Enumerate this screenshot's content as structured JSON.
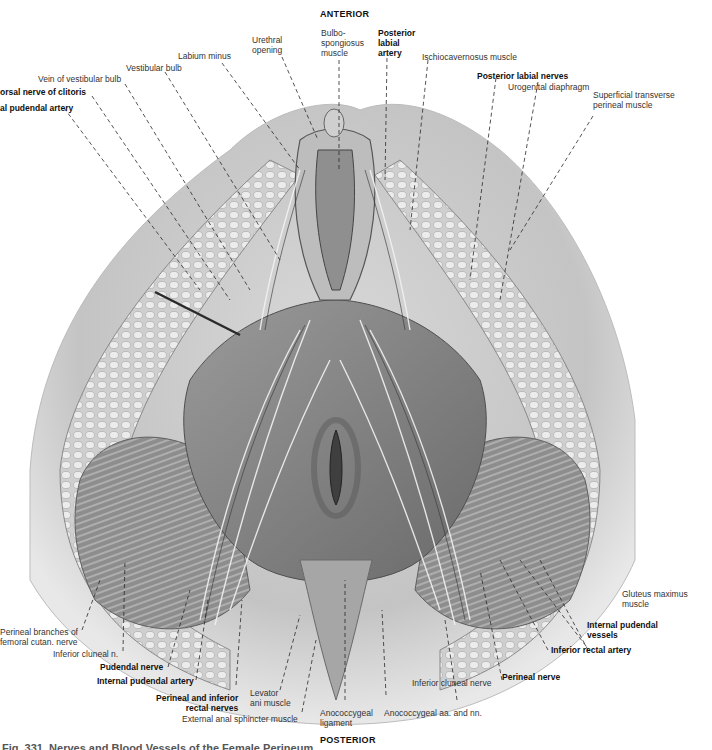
{
  "figure": {
    "orientation": {
      "top": "ANTERIOR",
      "bottom": "POSTERIOR"
    },
    "caption": "Fig. 331. Nerves and Blood Vessels of the Female Perineum",
    "labels": {
      "dorsal_nerve_clitoris": "orsal nerve of clitoris",
      "internal_pudendal_artery_top": "al pudendal artery",
      "vein_vestibular_bulb": "Vein of vestibular bulb",
      "vestibular_bulb": "Vestibular bulb",
      "labium_minus": "Labium minus",
      "urethral_opening": "Urethral\nopening",
      "bulbospongiosus": "Bulbo-\nspongiosus\nmuscle",
      "posterior_labial_artery": "Posterior\nlabial\nartery",
      "ischiocavernosus": "Ischiocavernosus muscle",
      "posterior_labial_nerves": "Posterior labial nerves",
      "urogenital_diaphragm": "Urogenital diaphragm",
      "superficial_transverse": "Superficial transverse\nperineal muscle",
      "gluteus_maximus": "Gluteus maximus\nmuscle",
      "internal_pudendal_vessels": "Internal pudendal\nvessels",
      "inferior_rectal_artery": "Inferior rectal artery",
      "perineal_nerve": "Perineal nerve",
      "inferior_cluneal_nerve_right": "Inferior cluneal nerve",
      "anococcygeal_aa_nn": "Anococcygeal aa. and nn.",
      "anococcygeal_ligament": "Anococcygeal\nligament",
      "external_anal_sphincter": "External anal sphincter muscle",
      "levator_ani": "Levator\nani muscle",
      "perineal_inferior_rectal_nerves": "Perineal and inferior\nrectal nerves",
      "internal_pudendal_artery_bottom": "Internal pudendal artery",
      "pudendal_nerve": "Pudendal nerve",
      "inferior_cluneal_n_left": "Inferior cluneal n.",
      "perineal_branches": "Perineal branches of\nfemoral cutan. nerve"
    },
    "colors": {
      "background": "#ffffff",
      "tissue_light": "#e6e6e6",
      "tissue_mid": "#b5b5b5",
      "tissue_dark": "#6e6e6e",
      "leader_line": "#2a2a2a"
    }
  }
}
